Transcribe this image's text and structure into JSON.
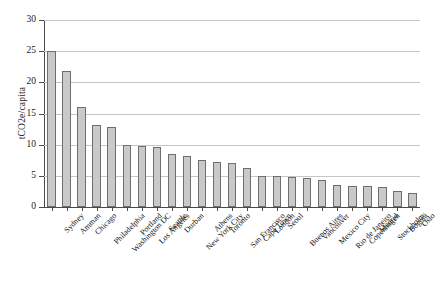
{
  "chart_data": {
    "type": "bar",
    "title": "",
    "subtitle": "",
    "xlabel": "",
    "ylabel": "tCO2e/capita",
    "ylim": [
      0,
      30
    ],
    "yticks": [
      0,
      5,
      10,
      15,
      20,
      25,
      30
    ],
    "grid": true,
    "legend": false,
    "bar_color": "#c9c9c9",
    "bar_edge_color": "#6e6e6e",
    "axis_color": "#4a4a4a",
    "gridline_color": "#c6c6c6",
    "categories": [
      "Sydney",
      "Amman",
      "Chicago",
      "Philadelphia",
      "Washington DC",
      "Portland",
      "Los Angeles",
      "Seattle",
      "Durban",
      "New York City",
      "Athens",
      "Toronto",
      "San Francisco",
      "Cape Town",
      "London",
      "Seoul",
      "Buenos Aires",
      "Vancouver",
      "Mexico City",
      "Rio de Janeiro",
      "Copenhagen",
      "Madrid",
      "Stockholm",
      "Bogotá",
      "Oslo"
    ],
    "values": [
      25.0,
      21.8,
      16.0,
      13.1,
      12.8,
      10.0,
      9.8,
      9.6,
      8.5,
      8.2,
      7.6,
      7.3,
      7.1,
      6.3,
      5.0,
      4.9,
      4.8,
      4.7,
      4.3,
      3.5,
      3.4,
      3.3,
      3.2,
      2.5,
      2.3
    ]
  }
}
